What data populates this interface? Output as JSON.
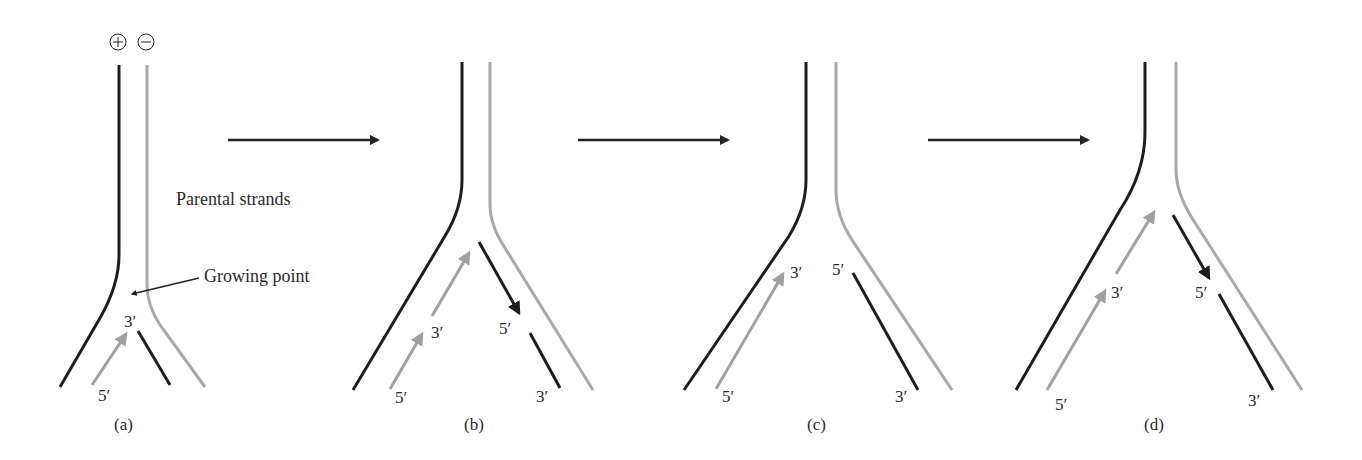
{
  "colors": {
    "parental_plus": "#1e1e1e",
    "parental_minus": "#a8a8a8",
    "new_black": "#1e1e1e",
    "new_grey": "#a0a0a0",
    "step_arrow": "#222222",
    "background": "#ffffff"
  },
  "strand_signs": {
    "plus": "+",
    "minus": "−"
  },
  "annotations": {
    "parental_strands": "Parental strands",
    "growing_point": "Growing point"
  },
  "panels": [
    {
      "caption": "(a)",
      "labels": {
        "grey_5": "5′",
        "grey_3": "3′"
      }
    },
    {
      "caption": "(b)",
      "labels": {
        "grey_5": "5′",
        "grey_3": "3′",
        "black_5": "5′",
        "black_3": "3′"
      }
    },
    {
      "caption": "(c)",
      "labels": {
        "grey_5": "5′",
        "grey_3": "3′",
        "black_5": "5′",
        "black_3": "3′"
      }
    },
    {
      "caption": "(d)",
      "labels": {
        "grey_5": "5′",
        "grey_3": "3′",
        "black_5": "5′",
        "black_3": "3′"
      }
    }
  ]
}
